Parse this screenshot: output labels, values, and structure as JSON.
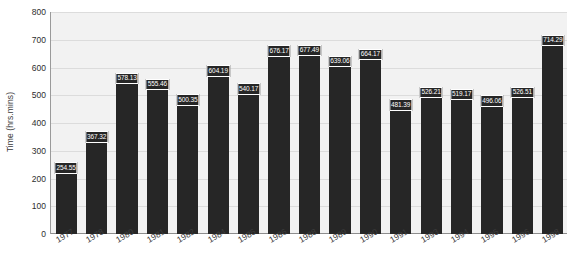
{
  "chart_data": {
    "type": "bar",
    "title": "",
    "xlabel": "",
    "ylabel": "Time (hrs.mins)",
    "ylim": [
      0,
      800
    ],
    "ytick_step": 100,
    "yticks": [
      800,
      700,
      600,
      500,
      400,
      300,
      200,
      100,
      0
    ],
    "grid": true,
    "legend": "none",
    "categories": [
      "1977",
      "1978",
      "1980",
      "1981",
      "1982",
      "1984",
      "1985",
      "1986",
      "1988",
      "1989",
      "1990",
      "1991",
      "1993",
      "1994",
      "1995",
      "1996",
      "1998"
    ],
    "values": [
      254.55,
      367.32,
      578.13,
      555.46,
      500.35,
      604.19,
      540.17,
      676.17,
      677.49,
      639.06,
      664.17,
      481.39,
      526.21,
      519.17,
      496.06,
      526.51,
      714.29
    ],
    "value_labels": [
      "254.55",
      "367.32",
      "578.13",
      "555.46",
      "500.35",
      "604.19",
      "540.17",
      "676.17",
      "677.49",
      "639.06",
      "664.17",
      "481.39",
      "526.21",
      "519.17",
      "496.06",
      "526.51",
      "714.29"
    ],
    "bar_color": "#262626",
    "plot_background": "#f2f2f2",
    "gridline_color": "#dcdcdc",
    "value_label_text_color": "#ffffff"
  }
}
